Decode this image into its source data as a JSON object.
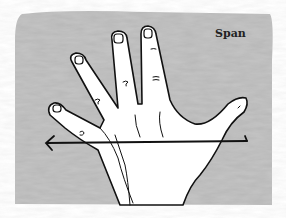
{
  "illustration": {
    "label": "Span",
    "subject": "open hand with fingers spread",
    "measurement": "span-arrow",
    "colors": {
      "background_paint": "#b8b8b8",
      "outline": "#111111",
      "hand_fill": "#ffffff"
    }
  }
}
